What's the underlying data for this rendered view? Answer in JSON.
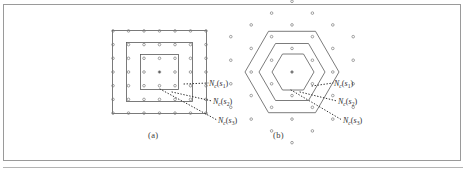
{
  "figure": {
    "caption_a": "(a)",
    "caption_b": "(b)",
    "panel_a": {
      "kind": "square-lattice",
      "grid_rows": 7,
      "grid_cols": 7,
      "nested_boundaries": 3,
      "labels": [
        {
          "id": "A1",
          "base": "N",
          "sub_base": "c",
          "arg": "s",
          "arg_sub": "1",
          "text": "N_c(s_1)"
        },
        {
          "id": "A2",
          "base": "N",
          "sub_base": "c",
          "arg": "s",
          "arg_sub": "2",
          "text": "N_c(s_2)"
        },
        {
          "id": "A3",
          "base": "N",
          "sub_base": "c",
          "arg": "s",
          "arg_sub": "3",
          "text": "N_c(s_3)"
        }
      ]
    },
    "panel_b": {
      "kind": "hexagonal-lattice",
      "rings": 3,
      "nested_boundaries": 3,
      "labels": [
        {
          "id": "B1",
          "base": "N",
          "sub_base": "c",
          "arg": "s",
          "arg_sub": "1",
          "text": "N_c(s_1)"
        },
        {
          "id": "B2",
          "base": "N",
          "sub_base": "c",
          "arg": "s",
          "arg_sub": "2",
          "text": "N_c(s_2)"
        },
        {
          "id": "B3",
          "base": "N",
          "sub_base": "c",
          "arg": "s",
          "arg_sub": "3",
          "text": "N_c(s_3)"
        }
      ]
    },
    "colors": {
      "frame": "#9a9a9a",
      "line": "#555555",
      "dot": "#7a7a7a",
      "leader": "#3a3a3a",
      "background": "#ffffff"
    }
  },
  "chart_data": {
    "type": "scatter",
    "title": "",
    "xlabel": "",
    "ylabel": "",
    "grid": false,
    "legend": "none",
    "panels": [
      {
        "name": "(a)",
        "lattice": "square",
        "description": "7x7 square lattice of cell centers with three nested square neighborhood boundaries around the center seed point",
        "neighborhood_levels": [
          "N_c(s_1)",
          "N_c(s_2)",
          "N_c(s_3)"
        ],
        "boundary_half_widths": [
          1.5,
          2.5,
          3.5
        ],
        "points": [
          [
            -3,
            -3
          ],
          [
            -2,
            -3
          ],
          [
            -1,
            -3
          ],
          [
            0,
            -3
          ],
          [
            1,
            -3
          ],
          [
            2,
            -3
          ],
          [
            3,
            -3
          ],
          [
            -3,
            -2
          ],
          [
            -2,
            -2
          ],
          [
            -1,
            -2
          ],
          [
            0,
            -2
          ],
          [
            1,
            -2
          ],
          [
            2,
            -2
          ],
          [
            3,
            -2
          ],
          [
            -3,
            -1
          ],
          [
            -2,
            -1
          ],
          [
            -1,
            -1
          ],
          [
            0,
            -1
          ],
          [
            1,
            -1
          ],
          [
            2,
            -1
          ],
          [
            3,
            -1
          ],
          [
            -3,
            0
          ],
          [
            -2,
            0
          ],
          [
            -1,
            0
          ],
          [
            0,
            0
          ],
          [
            1,
            0
          ],
          [
            2,
            0
          ],
          [
            3,
            0
          ],
          [
            -3,
            1
          ],
          [
            -2,
            1
          ],
          [
            -1,
            1
          ],
          [
            0,
            1
          ],
          [
            1,
            1
          ],
          [
            2,
            1
          ],
          [
            3,
            1
          ],
          [
            -3,
            2
          ],
          [
            -2,
            2
          ],
          [
            -1,
            2
          ],
          [
            0,
            2
          ],
          [
            1,
            2
          ],
          [
            2,
            2
          ],
          [
            3,
            2
          ],
          [
            -3,
            3
          ],
          [
            -2,
            3
          ],
          [
            -1,
            3
          ],
          [
            0,
            3
          ],
          [
            1,
            3
          ],
          [
            2,
            3
          ],
          [
            3,
            3
          ]
        ]
      },
      {
        "name": "(b)",
        "lattice": "hexagonal",
        "description": "Hexagonal lattice of cell centers with three nested hexagonal neighborhood boundaries around the center seed point",
        "neighborhood_levels": [
          "N_c(s_1)",
          "N_c(s_2)",
          "N_c(s_3)"
        ],
        "ring_counts": [
          1,
          6,
          12,
          18
        ],
        "total_points": 37
      }
    ]
  }
}
